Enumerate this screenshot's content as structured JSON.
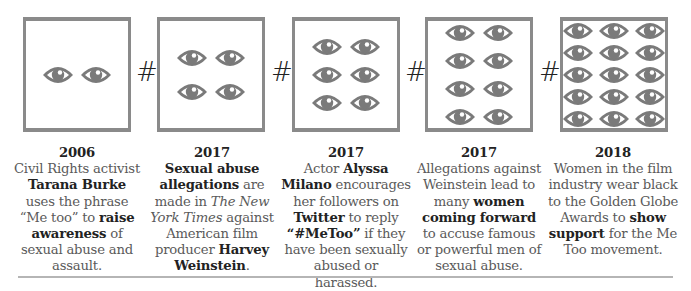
{
  "colors": {
    "box_border": "#8a8a8a",
    "eye": "#7a7a7a",
    "hash": "#222222",
    "text": "#5a5a5a",
    "bold_text": "#222222",
    "rule": "#b5b5b5"
  },
  "separator_symbol": "#",
  "timeline": [
    {
      "year": "2006",
      "eye_count": 2,
      "eye_columns": 2,
      "segments": [
        {
          "t": "Civil Rights activist ",
          "s": "normal"
        },
        {
          "t": "Tarana Burke",
          "s": "bold"
        },
        {
          "t": " uses the phrase “Me too” to ",
          "s": "normal"
        },
        {
          "t": "raise awareness",
          "s": "bold"
        },
        {
          "t": " of sexual abuse and assault.",
          "s": "normal"
        }
      ]
    },
    {
      "year": "2017",
      "eye_count": 4,
      "eye_columns": 2,
      "segments": [
        {
          "t": "Sexual abuse allegations",
          "s": "bold"
        },
        {
          "t": " are made in ",
          "s": "normal"
        },
        {
          "t": "The New York Times",
          "s": "italic"
        },
        {
          "t": " against American film producer ",
          "s": "normal"
        },
        {
          "t": "Harvey Weinstein",
          "s": "bold"
        },
        {
          "t": ".",
          "s": "normal"
        }
      ]
    },
    {
      "year": "2017",
      "eye_count": 6,
      "eye_columns": 2,
      "segments": [
        {
          "t": "Actor ",
          "s": "normal"
        },
        {
          "t": "Alyssa Milano",
          "s": "bold"
        },
        {
          "t": " encourages her followers on ",
          "s": "normal"
        },
        {
          "t": "Twitter",
          "s": "bold"
        },
        {
          "t": " to reply ",
          "s": "normal"
        },
        {
          "t": "“#MeToo”",
          "s": "bold"
        },
        {
          "t": " if they have been sexually abused or harassed.",
          "s": "normal"
        }
      ]
    },
    {
      "year": "2017",
      "eye_count": 8,
      "eye_columns": 2,
      "segments": [
        {
          "t": "Allegations against Weinstein lead to many ",
          "s": "normal"
        },
        {
          "t": "women coming forward",
          "s": "bold"
        },
        {
          "t": " to accuse famous or powerful men of sexual abuse.",
          "s": "normal"
        }
      ]
    },
    {
      "year": "2018",
      "eye_count": 15,
      "eye_columns": 3,
      "segments": [
        {
          "t": "Women in the film industry wear black to the Golden Globe Awards to ",
          "s": "normal"
        },
        {
          "t": "show support",
          "s": "bold"
        },
        {
          "t": " for the Me Too movement.",
          "s": "normal"
        }
      ]
    }
  ]
}
